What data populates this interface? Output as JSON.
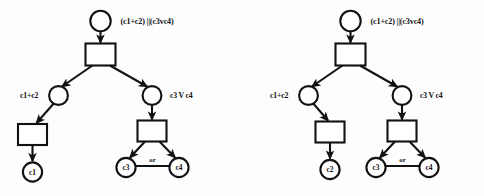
{
  "figure": {
    "type": "diagram",
    "background_color": "#fdfdfd",
    "stroke_color": "#121212"
  },
  "diagrams": [
    {
      "id": "left",
      "root_label": "(c1+c2) ||(c3vc4)",
      "branch_left_label": "c1+c2",
      "branch_right_label": "c3 V c4",
      "leaf_left": "c1",
      "leaf_right_a": "c3",
      "leaf_right_b": "c4",
      "or_label": "or"
    },
    {
      "id": "right",
      "root_label": "(c1+c2) ||(c3vc4)",
      "branch_left_label": "c1+c2",
      "branch_right_label": "c3 V c4",
      "leaf_left": "c2",
      "leaf_right_a": "c3",
      "leaf_right_b": "c4",
      "or_label": "or"
    }
  ],
  "glyphs": {
    "vee": "V",
    "parallel": "||",
    "plus": "+"
  }
}
